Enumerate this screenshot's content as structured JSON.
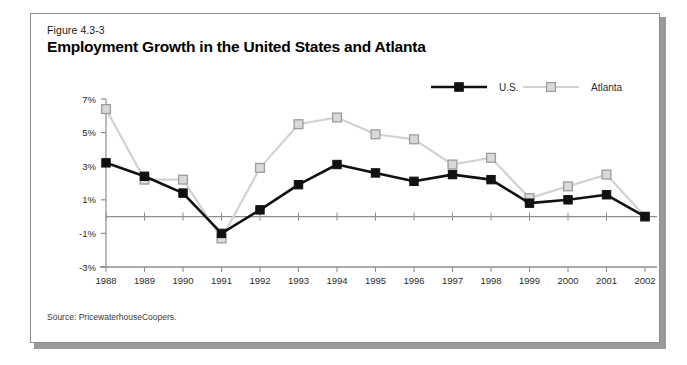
{
  "figure": {
    "label": "Figure 4.3-3",
    "title": "Employment Growth in the United States and Atlanta",
    "source": "Source: PricewaterhouseCoopers."
  },
  "colors": {
    "us_line": "#111111",
    "us_marker_fill": "#111111",
    "atlanta_line": "#d2d2d2",
    "atlanta_marker_fill": "#d9d9d9",
    "atlanta_marker_stroke": "#9c9c9c",
    "axis": "#8e8e8e",
    "text": "#1a1a1a",
    "frame_border": "#8e8e8e",
    "frame_shadow": "#9a9a9a",
    "background": "#ffffff"
  },
  "chart_data": {
    "type": "line",
    "title": "Employment Growth in the United States and Atlanta",
    "xlabel": "",
    "ylabel": "",
    "categories": [
      "1988",
      "1989",
      "1990",
      "1991",
      "1992",
      "1993",
      "1994",
      "1995",
      "1996",
      "1997",
      "1998",
      "1999",
      "2000",
      "2001",
      "2002"
    ],
    "yticks": [
      "7%",
      "5%",
      "3%",
      "1%",
      "-1%",
      "-3%"
    ],
    "ytick_values": [
      7,
      5,
      3,
      1,
      -1,
      -3
    ],
    "ylim": [
      -3,
      7
    ],
    "grid": false,
    "zero_line": true,
    "legend_position": "top-right",
    "series": [
      {
        "name": "U.S.",
        "marker": "filled-square",
        "values": [
          3.2,
          2.4,
          1.4,
          -1.0,
          0.4,
          1.9,
          3.1,
          2.6,
          2.1,
          2.5,
          2.2,
          0.8,
          1.0,
          1.3,
          0.0
        ]
      },
      {
        "name": "Atlanta",
        "marker": "open-square",
        "values": [
          6.4,
          2.2,
          2.2,
          -1.3,
          2.9,
          5.5,
          5.9,
          4.9,
          4.6,
          3.1,
          3.5,
          1.1,
          1.8,
          2.5,
          0.0
        ]
      }
    ]
  },
  "legend": {
    "items": [
      {
        "label": "U.S."
      },
      {
        "label": "Atlanta"
      }
    ]
  }
}
